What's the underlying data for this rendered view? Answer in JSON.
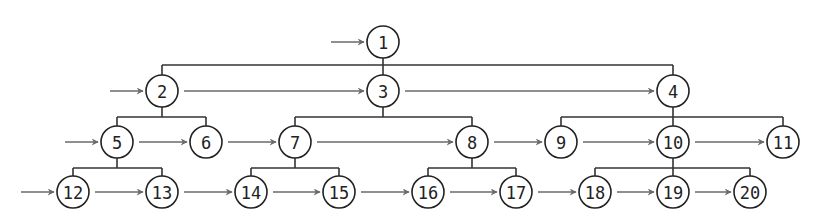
{
  "diagram": {
    "type": "tree-level-order-traversal",
    "node_radius": 16,
    "colors": {
      "node_stroke": "#222222",
      "edge": "#333333",
      "arrow": "#6a6a6a",
      "background": "#ffffff"
    },
    "nodes": [
      {
        "id": "1",
        "label": "1",
        "x": 383,
        "y": 42
      },
      {
        "id": "2",
        "label": "2",
        "x": 162,
        "y": 91
      },
      {
        "id": "3",
        "label": "3",
        "x": 383,
        "y": 91
      },
      {
        "id": "4",
        "label": "4",
        "x": 673,
        "y": 91
      },
      {
        "id": "5",
        "label": "5",
        "x": 117,
        "y": 142
      },
      {
        "id": "6",
        "label": "6",
        "x": 206,
        "y": 142
      },
      {
        "id": "7",
        "label": "7",
        "x": 295,
        "y": 142
      },
      {
        "id": "8",
        "label": "8",
        "x": 472,
        "y": 142
      },
      {
        "id": "9",
        "label": "9",
        "x": 561,
        "y": 142
      },
      {
        "id": "10",
        "label": "10",
        "x": 673,
        "y": 142
      },
      {
        "id": "11",
        "label": "11",
        "x": 783,
        "y": 142
      },
      {
        "id": "12",
        "label": "12",
        "x": 73,
        "y": 192
      },
      {
        "id": "13",
        "label": "13",
        "x": 162,
        "y": 192
      },
      {
        "id": "14",
        "label": "14",
        "x": 251,
        "y": 192
      },
      {
        "id": "15",
        "label": "15",
        "x": 339,
        "y": 192
      },
      {
        "id": "16",
        "label": "16",
        "x": 428,
        "y": 192
      },
      {
        "id": "17",
        "label": "17",
        "x": 516,
        "y": 192
      },
      {
        "id": "18",
        "label": "18",
        "x": 595,
        "y": 192
      },
      {
        "id": "19",
        "label": "19",
        "x": 673,
        "y": 192
      },
      {
        "id": "20",
        "label": "20",
        "x": 750,
        "y": 192
      }
    ],
    "tree_edges": [
      {
        "parent": "1",
        "children": [
          "2",
          "3",
          "4"
        ],
        "bar_y": 65
      },
      {
        "parent": "2",
        "children": [
          "5",
          "6"
        ],
        "bar_y": 117
      },
      {
        "parent": "3",
        "children": [
          "7",
          "8"
        ],
        "bar_y": 117
      },
      {
        "parent": "4",
        "children": [
          "9",
          "10",
          "11"
        ],
        "bar_y": 117
      },
      {
        "parent": "5",
        "children": [
          "12",
          "13"
        ],
        "bar_y": 168
      },
      {
        "parent": "7",
        "children": [
          "14",
          "15"
        ],
        "bar_y": 168
      },
      {
        "parent": "8",
        "children": [
          "16",
          "17"
        ],
        "bar_y": 168
      },
      {
        "parent": "10",
        "children": [
          "18",
          "19",
          "20"
        ],
        "bar_y": 168
      }
    ],
    "traversal_arrows": [
      {
        "from": null,
        "to": "1"
      },
      {
        "from": null,
        "to": "2"
      },
      {
        "from": "2",
        "to": "3"
      },
      {
        "from": "3",
        "to": "4"
      },
      {
        "from": null,
        "to": "5"
      },
      {
        "from": "5",
        "to": "6"
      },
      {
        "from": "6",
        "to": "7"
      },
      {
        "from": "7",
        "to": "8"
      },
      {
        "from": "8",
        "to": "9"
      },
      {
        "from": "9",
        "to": "10"
      },
      {
        "from": "10",
        "to": "11"
      },
      {
        "from": null,
        "to": "12"
      },
      {
        "from": "12",
        "to": "13"
      },
      {
        "from": "13",
        "to": "14"
      },
      {
        "from": "14",
        "to": "15"
      },
      {
        "from": "15",
        "to": "16"
      },
      {
        "from": "16",
        "to": "17"
      },
      {
        "from": "17",
        "to": "18"
      },
      {
        "from": "18",
        "to": "19"
      },
      {
        "from": "19",
        "to": "20"
      }
    ]
  }
}
